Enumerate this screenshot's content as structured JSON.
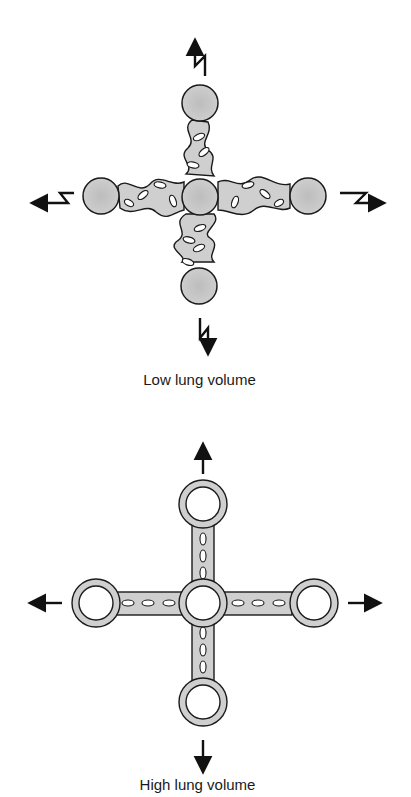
{
  "figure": {
    "panels": [
      {
        "id": "low",
        "caption": "Low lung volume",
        "alveoli": "solid gray, collapsed/tortuous interconnecting septa",
        "traction_arrows": [
          "up-zigzag",
          "left-zigzag",
          "right-zigzag",
          "down-zigzag"
        ]
      },
      {
        "id": "high",
        "caption": "High lung volume",
        "alveoli": "open rings with straight interconnecting septa",
        "traction_arrows": [
          "up",
          "left",
          "right",
          "down"
        ]
      }
    ],
    "colors": {
      "fill_gray": "#c8c8c8",
      "stroke": "#1a1a1a",
      "background": "#ffffff"
    }
  }
}
